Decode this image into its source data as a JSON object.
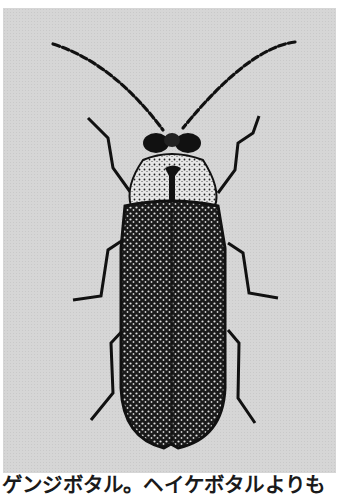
{
  "figure": {
    "background_color": "#d6d6d6",
    "ink_color": "#111111"
  },
  "caption": {
    "text": "ゲンジボタル。ヘイケボタルよりも"
  }
}
